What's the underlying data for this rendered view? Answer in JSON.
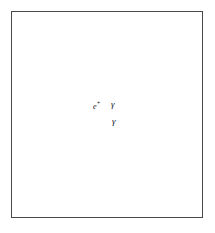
{
  "figure": {
    "kind": "detector-event-diagram",
    "frame": {
      "border_color": "#4a4a4e",
      "background": "#ffffff",
      "x": 11,
      "y": 11,
      "width": 192,
      "height": 207
    },
    "labels": [
      {
        "id": "positron",
        "text": "e",
        "superscript": "+",
        "x": 93,
        "y": 100
      },
      {
        "id": "photon-upper",
        "text": "γ",
        "x": 111,
        "y": 100
      },
      {
        "id": "photon-lower",
        "text": "γ",
        "x": 112,
        "y": 117
      }
    ],
    "colors": {
      "frame": "#4a4a4e",
      "wireframe": "#6f6f75",
      "ring_outline": "#5c5c62",
      "track_dark": "#1a1a1e",
      "track_grey": "#8e8e95",
      "beam_band": "#b4b4ba",
      "cone": "#9a9aa0"
    },
    "box": {
      "name": "detector-volume-wireframe",
      "front": {
        "left": 34,
        "top": 64,
        "right": 168,
        "bottom": 168
      },
      "depth_dx": 22,
      "depth_dy": -18
    },
    "rings": [
      {
        "id": "left-ring",
        "cx": 51,
        "cy": 110,
        "rx": 18,
        "ry": 28,
        "rotate": -8,
        "segments": 46
      },
      {
        "id": "right-ring-upper",
        "cx": 172,
        "cy": 96,
        "rx": 16,
        "ry": 24,
        "rotate": 4,
        "segments": 44
      },
      {
        "id": "right-ring-lower",
        "cx": 172,
        "cy": 138,
        "rx": 16,
        "ry": 24,
        "rotate": 4,
        "segments": 44
      }
    ],
    "vertex": {
      "x": 110,
      "y": 113
    },
    "track_count": 14,
    "cone_count": 2
  }
}
